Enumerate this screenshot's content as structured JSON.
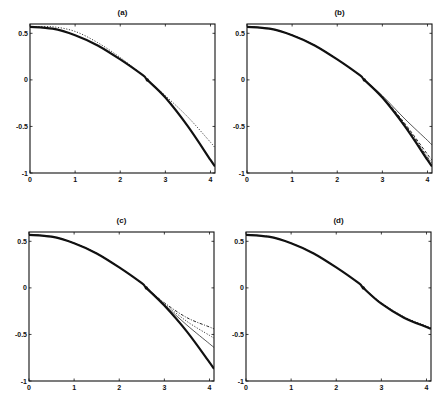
{
  "figure": {
    "panels": [
      {
        "id": "a",
        "title": "(a)",
        "box": {
          "left": 30,
          "top": 24,
          "right": 215,
          "bottom": 173
        }
      },
      {
        "id": "b",
        "title": "(b)",
        "box": {
          "left": 247,
          "top": 24,
          "right": 432,
          "bottom": 173
        }
      },
      {
        "id": "c",
        "title": "(c)",
        "box": {
          "left": 29,
          "top": 232,
          "right": 214,
          "bottom": 381
        }
      },
      {
        "id": "d",
        "title": "(d)",
        "box": {
          "left": 246,
          "top": 232,
          "right": 431,
          "bottom": 381
        }
      }
    ],
    "xticks": [
      0,
      1,
      2,
      3,
      4
    ],
    "xtick_labels": [
      "0",
      "1",
      "2",
      "3",
      "4"
    ],
    "yticks": [
      0.5,
      0,
      -0.5,
      -1
    ],
    "ytick_labels": [
      "0.5",
      "0",
      "-0.5",
      "-1"
    ],
    "xlim": [
      0,
      4.1
    ],
    "ylim": [
      -1,
      0.6
    ],
    "line_color": "#111111"
  },
  "chart_data": [
    {
      "type": "line",
      "title": "(a)",
      "xlabel": "",
      "ylabel": "",
      "xlim": [
        0,
        4.1
      ],
      "ylim": [
        -1,
        0.6
      ],
      "grid": false,
      "legend": null,
      "x": [
        0,
        0.5,
        1.0,
        1.5,
        2.0,
        2.5,
        2.6,
        3.0,
        3.5,
        4.0,
        4.1
      ],
      "series": [
        {
          "name": "exact",
          "style": "solid-thick",
          "values": [
            0.57,
            0.55,
            0.48,
            0.37,
            0.22,
            0.05,
            0.0,
            -0.19,
            -0.5,
            -0.86,
            -0.93
          ]
        },
        {
          "name": "approx",
          "style": "dotted",
          "values": [
            0.57,
            0.57,
            0.52,
            0.4,
            0.24,
            0.05,
            0.0,
            -0.17,
            -0.4,
            -0.67,
            -0.73
          ]
        }
      ],
      "annotations": [
        {
          "type": "marker",
          "x": 2.6,
          "y": 0.0
        }
      ]
    },
    {
      "type": "line",
      "title": "(b)",
      "xlabel": "",
      "ylabel": "",
      "xlim": [
        0,
        4.1
      ],
      "ylim": [
        -1,
        0.6
      ],
      "grid": false,
      "legend": null,
      "x": [
        0,
        0.5,
        1.0,
        1.5,
        2.0,
        2.5,
        2.6,
        3.0,
        3.5,
        4.0,
        4.1
      ],
      "series": [
        {
          "name": "exact",
          "style": "solid-thick",
          "values": [
            0.57,
            0.55,
            0.48,
            0.37,
            0.22,
            0.05,
            0.0,
            -0.19,
            -0.5,
            -0.86,
            -0.93
          ]
        },
        {
          "name": "approx-1",
          "style": "solid-thin",
          "values": [
            0.57,
            0.55,
            0.48,
            0.37,
            0.22,
            0.05,
            0.0,
            -0.17,
            -0.42,
            -0.65,
            -0.7
          ]
        },
        {
          "name": "approx-2",
          "style": "dashed",
          "values": [
            0.57,
            0.55,
            0.48,
            0.37,
            0.22,
            0.05,
            0.0,
            -0.18,
            -0.47,
            -0.8,
            -0.86
          ]
        },
        {
          "name": "approx-3",
          "style": "dash-dot",
          "values": [
            0.57,
            0.55,
            0.48,
            0.37,
            0.22,
            0.05,
            0.0,
            -0.185,
            -0.48,
            -0.83,
            -0.89
          ]
        }
      ],
      "annotations": [
        {
          "type": "marker",
          "x": 2.6,
          "y": 0.0
        }
      ]
    },
    {
      "type": "line",
      "title": "(c)",
      "xlabel": "",
      "ylabel": "",
      "xlim": [
        0,
        4.1
      ],
      "ylim": [
        -1,
        0.6
      ],
      "grid": false,
      "legend": null,
      "x": [
        0,
        0.5,
        1.0,
        1.5,
        2.0,
        2.5,
        2.6,
        3.0,
        3.5,
        4.0,
        4.1
      ],
      "series": [
        {
          "name": "exact",
          "style": "solid-thick",
          "values": [
            0.57,
            0.55,
            0.48,
            0.37,
            0.22,
            0.05,
            0.0,
            -0.19,
            -0.47,
            -0.8,
            -0.87
          ]
        },
        {
          "name": "approx-1",
          "style": "solid-thin",
          "values": [
            0.57,
            0.55,
            0.48,
            0.37,
            0.22,
            0.05,
            0.0,
            -0.18,
            -0.4,
            -0.6,
            -0.64
          ]
        },
        {
          "name": "approx-2",
          "style": "dotted",
          "values": [
            0.57,
            0.55,
            0.48,
            0.37,
            0.22,
            0.05,
            0.0,
            -0.17,
            -0.36,
            -0.51,
            -0.54
          ]
        },
        {
          "name": "approx-3",
          "style": "dash-dot",
          "values": [
            0.57,
            0.55,
            0.48,
            0.37,
            0.22,
            0.05,
            0.0,
            -0.16,
            -0.32,
            -0.42,
            -0.44
          ]
        }
      ],
      "annotations": [
        {
          "type": "marker",
          "x": 2.6,
          "y": 0.0
        }
      ]
    },
    {
      "type": "line",
      "title": "(d)",
      "xlabel": "",
      "ylabel": "",
      "xlim": [
        0,
        4.1
      ],
      "ylim": [
        -1,
        0.6
      ],
      "grid": false,
      "legend": null,
      "x": [
        0,
        0.5,
        1.0,
        1.5,
        2.0,
        2.5,
        2.6,
        3.0,
        3.5,
        4.0,
        4.1
      ],
      "series": [
        {
          "name": "exact",
          "style": "solid-thick",
          "values": [
            0.57,
            0.55,
            0.48,
            0.37,
            0.22,
            0.05,
            0.0,
            -0.17,
            -0.32,
            -0.42,
            -0.44
          ]
        },
        {
          "name": "approx-1",
          "style": "dotted",
          "values": [
            0.57,
            0.55,
            0.48,
            0.37,
            0.22,
            0.05,
            0.0,
            -0.16,
            -0.31,
            -0.41,
            -0.43
          ]
        },
        {
          "name": "approx-2",
          "style": "dashed",
          "values": [
            0.57,
            0.55,
            0.48,
            0.37,
            0.22,
            0.05,
            0.0,
            -0.165,
            -0.315,
            -0.415,
            -0.435
          ]
        }
      ],
      "annotations": [
        {
          "type": "marker",
          "x": 2.6,
          "y": 0.0
        }
      ]
    }
  ]
}
